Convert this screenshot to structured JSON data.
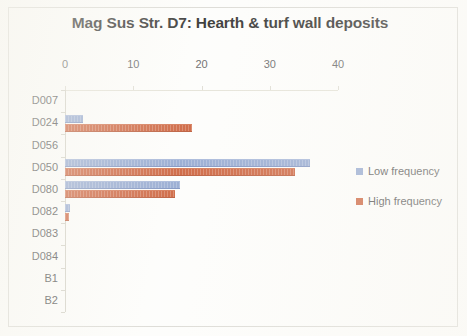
{
  "chart_data": {
    "type": "bar",
    "orientation": "horizontal",
    "title": "Mag Sus Str. D7: Hearth & turf wall deposits",
    "xlabel": "",
    "ylabel": "",
    "categories": [
      "D007",
      "D024",
      "D056",
      "D050",
      "D080",
      "D082",
      "D083",
      "D084",
      "B1",
      "B2"
    ],
    "series": [
      {
        "name": "Low frequency",
        "color": "#8ca2cd",
        "values": [
          0,
          2.6,
          0,
          35.9,
          16.8,
          0.7,
          0,
          0,
          0,
          0
        ]
      },
      {
        "name": "High frequency",
        "color": "#c8552c",
        "values": [
          0,
          18.6,
          0,
          33.7,
          16.1,
          0.6,
          0,
          0,
          0,
          0
        ]
      }
    ],
    "xticks": [
      0,
      10,
      20,
      30,
      40
    ],
    "xlim": [
      0,
      40
    ],
    "grid": false,
    "legend_position": "right",
    "axis_position": "top"
  },
  "legend": {
    "entries": [
      {
        "label": "Low frequency"
      },
      {
        "label": "High frequency"
      }
    ]
  }
}
